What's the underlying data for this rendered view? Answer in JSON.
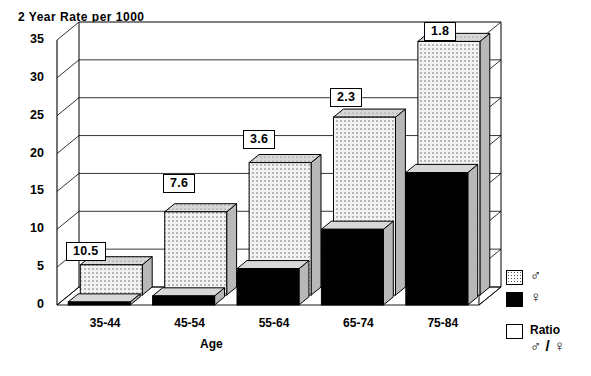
{
  "chart_data": {
    "type": "bar",
    "title": "2 Year Rate per 1000",
    "xlabel": "Age",
    "ylabel": "",
    "ylim": [
      0,
      35
    ],
    "yticks": [
      0,
      5,
      10,
      15,
      20,
      25,
      30,
      35
    ],
    "grid": true,
    "style": "3d-bar",
    "legend_position": "right",
    "categories": [
      "35-44",
      "45-54",
      "55-64",
      "65-74",
      "75-84"
    ],
    "series": [
      {
        "name": "♂",
        "key": "male",
        "values": [
          4.0,
          11.0,
          17.5,
          23.5,
          33.5
        ]
      },
      {
        "name": "♀",
        "key": "female",
        "values": [
          0.4,
          1.2,
          4.8,
          10.0,
          17.5
        ]
      }
    ],
    "annotations": {
      "label": "Ratio ♂/♀",
      "values": [
        "10.5",
        "7.6",
        "3.6",
        "2.3",
        "1.8"
      ]
    }
  },
  "legend": {
    "items": [
      {
        "swatch": "male-swatch",
        "label": "♂",
        "sub": ""
      },
      {
        "swatch": "female-swatch",
        "label": "♀",
        "sub": ""
      },
      {
        "swatch": "ratio-swatch",
        "label": "Ratio",
        "sub": "♂ / ♀"
      }
    ]
  },
  "colors": {
    "male_fill": "#f2f2f2",
    "female_fill": "#000000",
    "side_shade": "#b8b8b8",
    "top_shade": "#d8d8d8",
    "outline": "#000000",
    "wall": "#ffffff",
    "floor": "#ffffff"
  }
}
